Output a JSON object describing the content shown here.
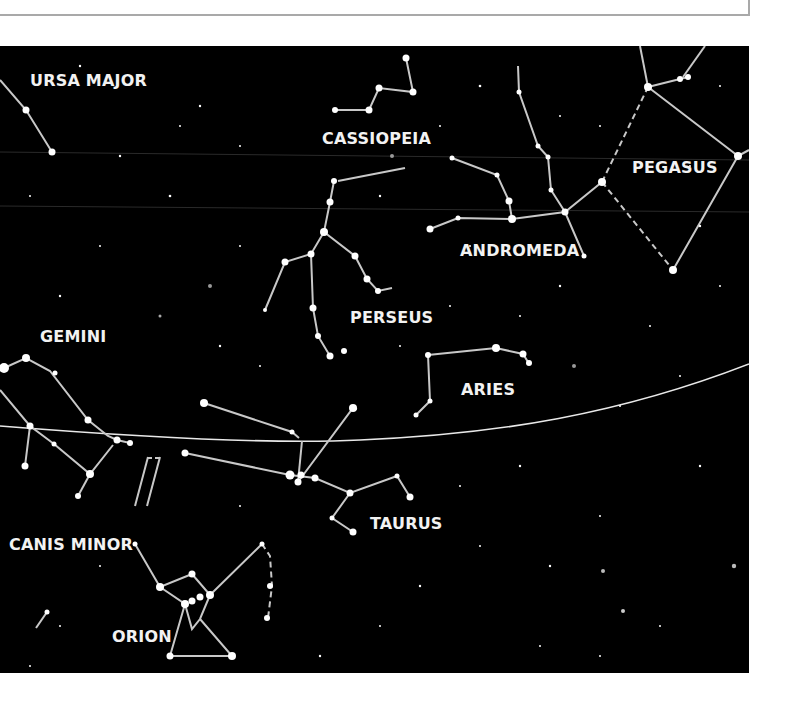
{
  "header_box": {},
  "map": {
    "background": "#000000",
    "line_color": "#c8c8c8",
    "label_color": "#f2f2f2",
    "labels": [
      {
        "id": "ursa-major",
        "text": "URSA MAJOR",
        "x": 30,
        "y": 40
      },
      {
        "id": "cassiopeia",
        "text": "CASSIOPEIA",
        "x": 322,
        "y": 98
      },
      {
        "id": "pegasus",
        "text": "PEGASUS",
        "x": 632,
        "y": 127
      },
      {
        "id": "andromeda",
        "text": "ANDROMEDA",
        "x": 460,
        "y": 210
      },
      {
        "id": "perseus",
        "text": "PERSEUS",
        "x": 350,
        "y": 277
      },
      {
        "id": "gemini",
        "text": "GEMINI",
        "x": 40,
        "y": 296
      },
      {
        "id": "aries",
        "text": "ARIES",
        "x": 461,
        "y": 349
      },
      {
        "id": "taurus",
        "text": "TAURUS",
        "x": 370,
        "y": 483
      },
      {
        "id": "canis-minor",
        "text": "CANIS MINOR",
        "x": 9,
        "y": 504
      },
      {
        "id": "orion",
        "text": "ORION",
        "x": 112,
        "y": 596
      }
    ]
  }
}
